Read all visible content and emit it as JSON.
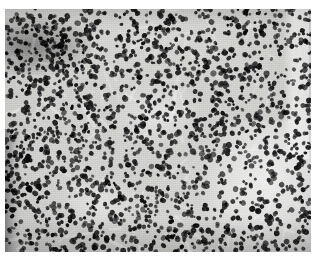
{
  "document": {
    "type": "micrograph",
    "title": "Histopathology micrograph",
    "caption": ""
  },
  "page": {
    "width": 317,
    "height": 259,
    "background_color": "#ffffff"
  },
  "micrograph": {
    "name": "histology-micrograph",
    "alt_text": "Grayscale histology micrograph showing densely packed small round dark-staining nuclei on a pale gray stromal background",
    "x": 5,
    "y": 9,
    "width": 306,
    "height": 243,
    "color_mode": "grayscale",
    "background_color": "#d6d6d3",
    "nucleus_color": "#141414",
    "stroma_light_color": "#f2f2f0",
    "stroma_dark_color": "#9a9a97",
    "staining": "hematoxylin and eosin",
    "magnification": "",
    "scale_bar": "",
    "label": "",
    "features": {
      "cell_count_estimate": 2300,
      "nucleus_diameter_px_min": 2.6,
      "nucleus_diameter_px_max": 5.4,
      "pattern": "diffuse sheets of small round cells with scant cytoplasm"
    },
    "regions": [
      {
        "name": "dense-dark-band-top-left",
        "description": "Condensed darkly stained band of overlapping nuclei",
        "x": 0,
        "y": 8,
        "width": 92,
        "height": 58,
        "density": 1.65,
        "tone": "dark"
      },
      {
        "name": "dark-streak-left-edge",
        "description": "Vertical dark crowded streak along lower left margin",
        "x": 0,
        "y": 120,
        "width": 16,
        "height": 123,
        "density": 1.45,
        "tone": "dark"
      },
      {
        "name": "pale-clearing-lower-right",
        "description": "Pale hypocellular clearing with sparse nuclei",
        "x": 200,
        "y": 112,
        "width": 106,
        "height": 131,
        "density": 0.55,
        "tone": "pale"
      },
      {
        "name": "pale-vertical-stripe-right",
        "description": "Narrow pale vertical band at the far right edge",
        "x": 282,
        "y": 0,
        "width": 24,
        "height": 150,
        "density": 0.45,
        "tone": "pale"
      },
      {
        "name": "pale-clearing-center",
        "description": "Small pale clearing in the mid-field",
        "x": 108,
        "y": 74,
        "width": 86,
        "height": 64,
        "density": 0.78,
        "tone": "pale"
      },
      {
        "name": "pale-clearing-lower-center",
        "description": "Small pale clearing lower center-left",
        "x": 58,
        "y": 170,
        "width": 74,
        "height": 50,
        "density": 0.8,
        "tone": "pale"
      },
      {
        "name": "dense-field-center",
        "description": "Diffuse densely cellular field occupying most of the frame",
        "x": 0,
        "y": 0,
        "width": 306,
        "height": 243,
        "density": 1.0,
        "tone": "neutral"
      }
    ],
    "seed": 20240517
  }
}
